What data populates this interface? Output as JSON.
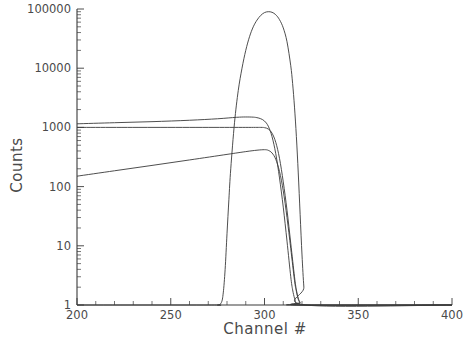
{
  "chart_data": {
    "type": "line",
    "title": "",
    "xlabel": "Channel #",
    "ylabel": "Counts",
    "xlim": [
      200,
      400
    ],
    "ylim": [
      1,
      100000
    ],
    "yscale": "log",
    "xscale": "linear",
    "grid": false,
    "legend": null,
    "xticks": [
      200,
      250,
      300,
      350,
      400
    ],
    "xtick_labels": [
      "200",
      "250",
      "300",
      "350",
      "400"
    ],
    "xminor_tick_step": 10,
    "yticks": [
      1,
      10,
      100,
      1000,
      10000,
      100000
    ],
    "ytick_labels": [
      "1",
      "10",
      "100",
      "1000",
      "10000",
      "100000"
    ],
    "yminor_ticks_per_decade": 9,
    "series": [
      {
        "name": "peak-curve",
        "comment": "tall narrow peak rising from baseline near channel 278, apex ~90000 near channel 302, falling to 1 by channel 322",
        "x": [
          200,
          270,
          275,
          277,
          278,
          279,
          280,
          281,
          282,
          284,
          286,
          288,
          290,
          292,
          294,
          296,
          298,
          300,
          302,
          304,
          306,
          308,
          310,
          312,
          314,
          315,
          316,
          317,
          318,
          319,
          320,
          321,
          322,
          400
        ],
        "y": [
          1,
          1,
          1,
          1.1,
          1.6,
          4,
          16,
          60,
          200,
          1200,
          4200,
          10000,
          20000,
          34000,
          50000,
          65000,
          78000,
          87000,
          90000,
          88000,
          80000,
          66000,
          48000,
          28000,
          11000,
          5500,
          2200,
          700,
          170,
          34,
          7,
          2,
          1,
          1
        ]
      },
      {
        "name": "upper-plateau-curve",
        "comment": "flat near 1150 at channel 200 rising slowly to ~1500 then bending down sharply at ~300, reaching 1 by channel 318",
        "x": [
          200,
          220,
          240,
          260,
          275,
          285,
          290,
          294,
          296,
          298,
          300,
          302,
          304,
          306,
          308,
          310,
          312,
          314,
          315,
          316,
          317,
          318,
          400
        ],
        "y": [
          1150,
          1200,
          1250,
          1320,
          1400,
          1480,
          1500,
          1490,
          1460,
          1400,
          1280,
          1050,
          700,
          360,
          140,
          45,
          12,
          3,
          1.8,
          1.3,
          1.05,
          1,
          1
        ]
      },
      {
        "name": "lower-plateau-curve",
        "comment": "flat at 1000 across the range then dropping steeply after channel 300 to 1 near channel 320",
        "x": [
          200,
          240,
          270,
          290,
          298,
          300,
          302,
          304,
          306,
          308,
          310,
          312,
          314,
          316,
          317,
          318,
          319,
          320,
          400
        ],
        "y": [
          1000,
          1000,
          1000,
          1000,
          1000,
          990,
          940,
          800,
          560,
          300,
          120,
          40,
          11,
          3,
          1.8,
          1.3,
          1.1,
          1,
          1
        ]
      },
      {
        "name": "rising-ramp-curve",
        "comment": "log-linear ramp from ~150 at channel 200 up to ~420 near channel 300, then sharp drop to 1 by channel 320",
        "x": [
          200,
          220,
          240,
          260,
          280,
          290,
          296,
          300,
          302,
          304,
          306,
          308,
          310,
          312,
          314,
          316,
          317,
          318,
          319,
          320,
          400
        ],
        "y": [
          150,
          185,
          228,
          282,
          350,
          390,
          412,
          420,
          410,
          370,
          290,
          180,
          85,
          30,
          9,
          2.6,
          1.7,
          1.25,
          1.08,
          1,
          1
        ]
      }
    ]
  },
  "axes": {
    "ylabel": "Counts",
    "xlabel": "Channel #"
  }
}
